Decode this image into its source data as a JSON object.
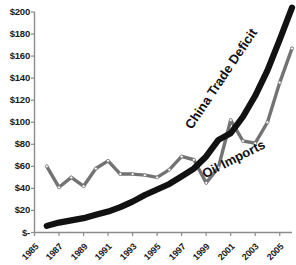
{
  "chart_data": {
    "type": "line",
    "title": "",
    "xlabel": "",
    "ylabel": "",
    "ylim": [
      0,
      200
    ],
    "xlim": [
      1985,
      2006
    ],
    "grid": false,
    "legend_position": "inline-series-labels",
    "y_tick_labels": [
      "$200",
      "$180",
      "$160",
      "$140",
      "$120",
      "$100",
      "$80",
      "$60",
      "$40",
      "$20",
      "$-"
    ],
    "y_tick_values": [
      200,
      180,
      160,
      140,
      120,
      100,
      80,
      60,
      40,
      20,
      0
    ],
    "x_tick_labels": [
      "1985",
      "1987",
      "1989",
      "1991",
      "1993",
      "1995",
      "1997",
      "1999",
      "2001",
      "2003",
      "2005"
    ],
    "x_tick_values": [
      1985,
      1987,
      1989,
      1991,
      1993,
      1995,
      1997,
      1999,
      2001,
      2003,
      2005
    ],
    "x": [
      1986,
      1987,
      1988,
      1989,
      1990,
      1991,
      1992,
      1993,
      1994,
      1995,
      1996,
      1997,
      1998,
      1999,
      2000,
      2001,
      2002,
      2003,
      2004,
      2005,
      2006
    ],
    "series": [
      {
        "name": "China Trade Deficit",
        "color": "#111111",
        "style": "thick-solid",
        "markers": false,
        "values": [
          6,
          9,
          11,
          13,
          16,
          19,
          23,
          28,
          34,
          39,
          44,
          51,
          58,
          69,
          84,
          90,
          105,
          124,
          147,
          175,
          204
        ]
      },
      {
        "name": "Oil Imports",
        "color": "#737373",
        "style": "solid",
        "markers": true,
        "marker_fill": "#ffffff",
        "values": [
          60,
          41,
          50,
          42,
          58,
          65,
          53,
          53,
          52,
          50,
          57,
          69,
          66,
          45,
          59,
          102,
          83,
          81,
          100,
          136,
          167
        ]
      }
    ],
    "annotations": [
      {
        "text": "China Trade Deficit",
        "rotation": -56
      },
      {
        "text": "Oil Imports",
        "rotation": -27
      }
    ],
    "axis_color": "#8c8c8c",
    "text_color": "#1a1a1a",
    "background": "#ffffff"
  },
  "axis": {
    "y_labels": [
      "$200",
      "$180",
      "$160",
      "$140",
      "$120",
      "$100",
      "$80",
      "$60",
      "$40",
      "$20",
      "$-"
    ],
    "x_labels": [
      "1985",
      "1987",
      "1989",
      "1991",
      "1993",
      "1995",
      "1997",
      "1999",
      "2001",
      "2003",
      "2005"
    ]
  },
  "labels": {
    "china": "China Trade Deficit",
    "oil": "Oil Imports"
  }
}
